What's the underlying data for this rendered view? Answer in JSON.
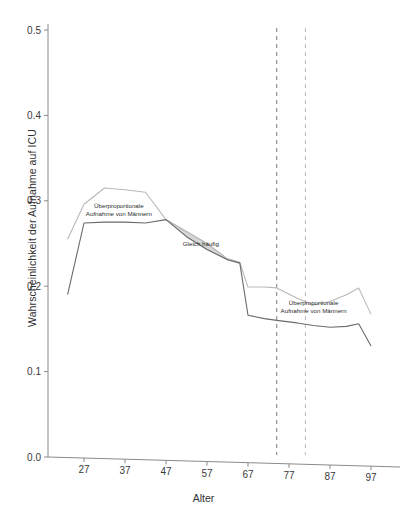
{
  "chart_data": {
    "type": "line",
    "title": "",
    "subtitle": "",
    "xlabel": "Alter",
    "ylabel": "Wahrscheinlichkeit der Aufnahme auf ICU",
    "xlim": [
      22,
      99
    ],
    "ylim": [
      0.0,
      0.52
    ],
    "grid": false,
    "legend": "none (inline annotations)",
    "xticks": [
      27,
      37,
      47,
      57,
      67,
      77,
      87,
      97
    ],
    "xtick_labels": [
      "27",
      "37",
      "47",
      "57",
      "67",
      "77",
      "87",
      "97"
    ],
    "yticks": [
      0.0,
      0.1,
      0.2,
      0.3,
      0.4,
      0.5
    ],
    "ytick_labels": [
      "0.0",
      "0.1",
      "0.2",
      "0.3",
      "0.4",
      "0.5"
    ],
    "series": [
      {
        "name": "Maenner",
        "color": "#b9b9b9",
        "x": [
          23,
          27,
          32,
          37,
          42,
          47,
          52,
          57,
          62,
          65,
          67,
          71,
          74,
          79,
          83,
          87,
          91,
          94,
          97
        ],
        "values": [
          0.255,
          0.296,
          0.315,
          0.313,
          0.31,
          0.278,
          0.264,
          0.25,
          0.232,
          0.228,
          0.199,
          0.199,
          0.198,
          0.186,
          0.178,
          0.182,
          0.19,
          0.198,
          0.167
        ]
      },
      {
        "name": "Frauen",
        "color": "#6b6b6b",
        "x": [
          23,
          27,
          32,
          37,
          42,
          47,
          52,
          57,
          62,
          65,
          67,
          71,
          74,
          79,
          83,
          87,
          91,
          94,
          97
        ],
        "values": [
          0.19,
          0.274,
          0.275,
          0.275,
          0.274,
          0.278,
          0.258,
          0.243,
          0.231,
          0.227,
          0.166,
          0.162,
          0.16,
          0.157,
          0.154,
          0.152,
          0.153,
          0.156,
          0.13
        ]
      }
    ],
    "shaded_band": {
      "label": "Gleich häufig",
      "fill": "#d4d4d4",
      "x_start": 47,
      "x_end": 65
    },
    "vlines": [
      {
        "x": 74,
        "style": "dashed",
        "color": "#6e6e6e"
      },
      {
        "x": 81,
        "style": "dashed",
        "color": "#b0b0b0"
      }
    ],
    "annotations": [
      {
        "name": "annotation-upper",
        "line1": "Überproportionale",
        "line2": "Aufnahme von Männern",
        "x": 35.5,
        "y": 0.292
      },
      {
        "name": "annotation-band",
        "line1": "Gleich häufig",
        "line2": "",
        "x": 55.5,
        "y": 0.2475
      },
      {
        "name": "annotation-lower",
        "line1": "Überproportionale",
        "line2": "Aufnahme von Männern",
        "x": 83.0,
        "y": 0.178
      }
    ]
  },
  "axes": {
    "x_title": "Alter",
    "y_title": "Wahrscheinlichkeit der Aufnahme auf ICU"
  },
  "colors": {
    "axis": "#8a8a8a",
    "text": "#2f2f2f",
    "series_light": "#b9b9b9",
    "series_dark": "#6b6b6b",
    "band_fill": "#d4d4d4",
    "vline_dark": "#6e6e6e",
    "vline_light": "#b0b0b0",
    "background": "#ffffff"
  }
}
